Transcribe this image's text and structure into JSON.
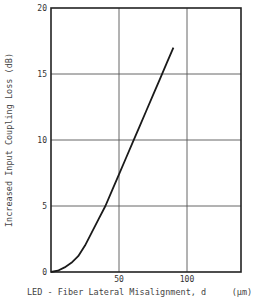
{
  "chart_data": {
    "type": "line",
    "title": "",
    "xlabel": "LED - Fiber Lateral Misalignment, d",
    "xunit": "(µm)",
    "ylabel": "Increased Input Coupling Loss (dB)",
    "xlim": [
      0,
      140
    ],
    "ylim": [
      0,
      20
    ],
    "xticks": [
      50,
      100
    ],
    "yticks": [
      0,
      5,
      10,
      15,
      20
    ],
    "grid": true,
    "series": [
      {
        "name": "coupling loss",
        "x": [
          0,
          5,
          10,
          15,
          20,
          25,
          30,
          35,
          40,
          45,
          50,
          55,
          60,
          65,
          70,
          75,
          80,
          85,
          90
        ],
        "y": [
          0,
          0.1,
          0.35,
          0.7,
          1.2,
          2.0,
          3.0,
          4.0,
          5.0,
          6.2,
          7.4,
          8.6,
          9.8,
          11.0,
          12.2,
          13.4,
          14.6,
          15.8,
          17.0
        ]
      }
    ]
  },
  "labels": {
    "y_axis": "Increased Input Coupling Loss (dB)",
    "x_axis": "LED - Fiber Lateral Misalignment, d",
    "x_unit": "(µm)",
    "y_ticks": [
      "0",
      "5",
      "10",
      "15",
      "20"
    ],
    "x_ticks": [
      "50",
      "100"
    ]
  }
}
